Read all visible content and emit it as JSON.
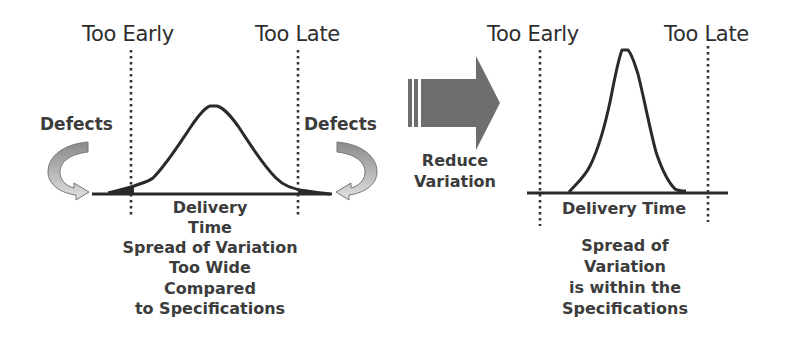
{
  "left_panel": {
    "spec_labels": {
      "early": "Too Early",
      "late": "Too Late"
    },
    "defects_left": "Defects",
    "defects_right": "Defects",
    "axis_label_lines": [
      "Delivery",
      "Time"
    ],
    "caption_lines": [
      "Spread of Variation",
      "Too Wide",
      "Compared",
      "to Specifications"
    ]
  },
  "transition": {
    "label_lines": [
      "Reduce",
      "Variation"
    ],
    "arrow_color": "#6e6e6e"
  },
  "right_panel": {
    "spec_labels": {
      "early": "Too Early",
      "late": "Too Late"
    },
    "axis_label": "Delivery Time",
    "caption_lines": [
      "Spread of",
      "Variation",
      "is within the",
      "Specifications"
    ]
  },
  "colors": {
    "curve": "#2a2a2a",
    "text": "#3c3c3c",
    "defect_arrow_top": "#8c8c8c",
    "defect_arrow_bottom": "#d6d6d6"
  }
}
